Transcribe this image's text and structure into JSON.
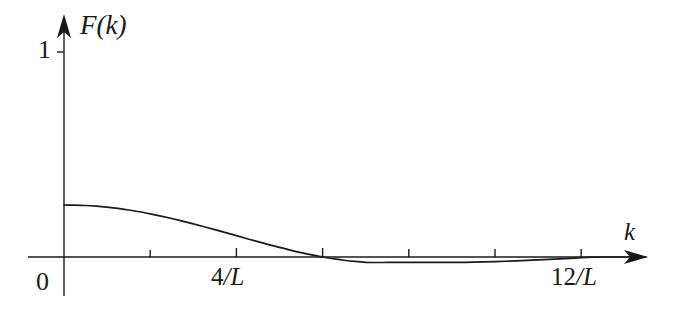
{
  "figure": {
    "title": "",
    "axes": {
      "y_axis_label": "F(k)",
      "x_axis_label": "k",
      "y_tick_label_top": "1",
      "origin_label": "0",
      "x_tick_labels": [
        {
          "text_num": "4",
          "text_slash": "/",
          "text_den": "L",
          "value": 4
        },
        {
          "text_num": "12",
          "text_slash": "/",
          "text_den": "L",
          "value": 12
        }
      ]
    },
    "colors": {
      "curve": "#1a1a1a",
      "axis": "#1a1a1a",
      "background": "#ffffff",
      "text": "#1a1a1a"
    }
  },
  "chart_data": {
    "type": "line",
    "title": "",
    "xlabel": "k",
    "ylabel": "F(k)",
    "xlim": [
      0,
      13.5
    ],
    "ylim": [
      -0.12,
      1.05
    ],
    "grid": false,
    "legend": null,
    "x_unit": "1/L",
    "x_ticks": [
      2,
      4,
      6,
      8,
      10,
      12
    ],
    "x_tick_labels": [
      "",
      "4/L",
      "",
      "",
      "",
      "12/L"
    ],
    "y_ticks": [
      0,
      1
    ],
    "y_tick_labels": [
      "0",
      "1"
    ],
    "series": [
      {
        "name": "F(k)",
        "x": [
          0,
          0.25,
          0.5,
          0.75,
          1,
          1.25,
          1.5,
          1.75,
          2,
          2.25,
          2.5,
          2.75,
          3,
          3.25,
          3.5,
          3.75,
          4,
          4.25,
          4.5,
          4.75,
          5,
          5.25,
          5.5,
          5.75,
          6,
          6.1,
          6.25,
          6.5,
          6.75,
          7,
          7.25,
          7.5,
          7.75,
          8,
          8.25,
          8.5,
          8.75,
          9,
          9.25,
          9.5,
          9.75,
          10,
          10.25,
          10.5,
          10.75,
          11,
          11.25,
          11.5,
          11.75,
          12,
          12.25,
          12.5,
          13,
          13.5
        ],
        "y": [
          1.0,
          0.997,
          0.99,
          0.977,
          0.958,
          0.934,
          0.904,
          0.87,
          0.83,
          0.787,
          0.74,
          0.69,
          0.637,
          0.582,
          0.526,
          0.468,
          0.41,
          0.352,
          0.295,
          0.239,
          0.185,
          0.133,
          0.085,
          0.04,
          0.0,
          -0.014,
          -0.034,
          -0.063,
          -0.086,
          -0.102,
          -0.106,
          -0.105,
          -0.104,
          -0.103,
          -0.104,
          -0.105,
          -0.105,
          -0.105,
          -0.103,
          -0.1,
          -0.095,
          -0.089,
          -0.082,
          -0.074,
          -0.065,
          -0.056,
          -0.046,
          -0.036,
          -0.025,
          -0.013,
          -0.004,
          0.0,
          0.0,
          0.0
        ]
      }
    ]
  },
  "geometry": {
    "origin_px": {
      "x": 64,
      "y": 257
    },
    "x_axis_end_px": 648,
    "y_axis_top_px": 14,
    "unit_y_px": 52,
    "px_per_invL": 43.1,
    "tick_half_len_px": 7
  }
}
